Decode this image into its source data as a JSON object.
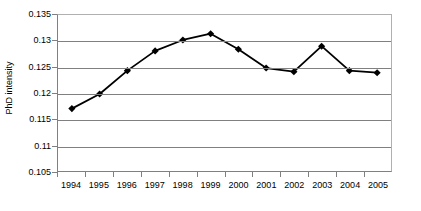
{
  "chart_data": {
    "type": "line",
    "title": "",
    "xlabel": "",
    "ylabel": "PhD intensity",
    "categories": [
      "1994",
      "1995",
      "1996",
      "1997",
      "1998",
      "1999",
      "2000",
      "2001",
      "2002",
      "2003",
      "2004",
      "2005"
    ],
    "values": [
      0.117,
      0.1198,
      0.1243,
      0.1281,
      0.1302,
      0.1314,
      0.1284,
      0.1248,
      0.1241,
      0.129,
      0.1243,
      0.1239
    ],
    "series": [
      {
        "name": "PhD intensity",
        "values": [
          0.117,
          0.1198,
          0.1243,
          0.1281,
          0.1302,
          0.1314,
          0.1284,
          0.1248,
          0.1241,
          0.129,
          0.1243,
          0.1239
        ]
      }
    ],
    "ylim": [
      0.105,
      0.135
    ],
    "ytick_labels": [
      "0.135",
      "0.13",
      "0.125",
      "0.12",
      "0.115",
      "0.11",
      "0.105"
    ],
    "ytick_values": [
      0.135,
      0.13,
      0.125,
      0.12,
      0.115,
      0.11,
      0.105
    ],
    "grid": true,
    "grid_axis": "y",
    "legend": false,
    "legend_position": "none",
    "marker": "diamond",
    "line_color": "#000000",
    "marker_color": "#000000",
    "grid_color": "#808080",
    "background_color": "#ffffff"
  }
}
